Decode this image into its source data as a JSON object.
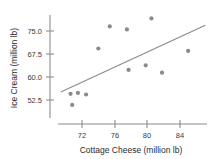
{
  "chart_data": {
    "type": "scatter",
    "title": "",
    "xlabel": "Cottage Cheese (million lb)",
    "ylabel": "Ice Cream (million lb)",
    "xticks": [
      "72",
      "76",
      "80",
      "84"
    ],
    "xtick_values": [
      72,
      76,
      80,
      84
    ],
    "yticks": [
      "75.0",
      "67.5",
      "60.0",
      "52.5"
    ],
    "ytick_values": [
      75.0,
      67.5,
      60.0,
      52.5
    ],
    "xlim": [
      69.3,
      87.2
    ],
    "ylim": [
      49.0,
      79.5
    ],
    "grid": false,
    "legend": null,
    "marker": "filled-circle",
    "marker_color": "#8a8a8a",
    "points": [
      {
        "x": 70.6,
        "y": 54.5
      },
      {
        "x": 70.8,
        "y": 50.9
      },
      {
        "x": 71.5,
        "y": 54.8
      },
      {
        "x": 72.5,
        "y": 54.3
      },
      {
        "x": 74.0,
        "y": 69.3
      },
      {
        "x": 75.4,
        "y": 76.5
      },
      {
        "x": 77.5,
        "y": 75.5
      },
      {
        "x": 77.7,
        "y": 62.3
      },
      {
        "x": 79.8,
        "y": 63.8
      },
      {
        "x": 80.5,
        "y": 79.1
      },
      {
        "x": 81.8,
        "y": 61.4
      },
      {
        "x": 85.0,
        "y": 68.5
      }
    ],
    "trendline": {
      "present": true,
      "x_start": 69.4,
      "y_start": 55.1,
      "x_end": 87.1,
      "y_end": 76.9,
      "color": "#8a8a8a"
    }
  }
}
